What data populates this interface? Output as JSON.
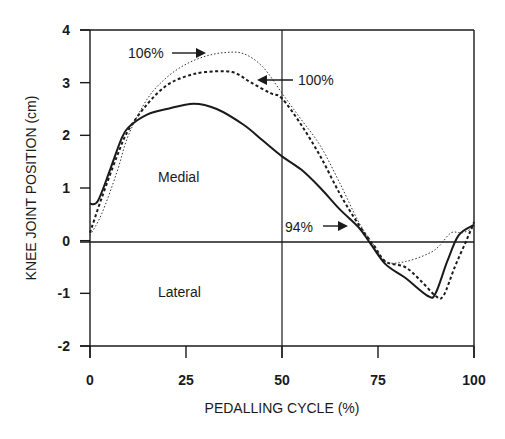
{
  "chart_data": {
    "type": "line",
    "title": "",
    "xlabel": "PEDALLING CYCLE (%)",
    "ylabel": "KNEE JOINT POSITION (cm)",
    "xlim": [
      0,
      100
    ],
    "ylim": [
      -2,
      4
    ],
    "xticks": [
      0,
      25,
      50,
      75,
      100
    ],
    "yticks": [
      -2,
      -1,
      0,
      1,
      2,
      3,
      4
    ],
    "grid": false,
    "reference_lines": {
      "horizontal": [
        0
      ],
      "vertical": [
        50
      ]
    },
    "region_labels": [
      {
        "text": "Medial",
        "x": 18,
        "y": 1.2
      },
      {
        "text": "Lateral",
        "x": 18,
        "y": -0.95
      }
    ],
    "series": [
      {
        "name": "94%",
        "style": "solid",
        "x": [
          0,
          2,
          5,
          8,
          10,
          15,
          20,
          27,
          33,
          40,
          45,
          50,
          55,
          60,
          65,
          70,
          73,
          77,
          82,
          88,
          90,
          93,
          96,
          100
        ],
        "y": [
          0.7,
          0.75,
          1.3,
          1.9,
          2.15,
          2.4,
          2.5,
          2.6,
          2.5,
          2.2,
          1.9,
          1.6,
          1.35,
          1.0,
          0.6,
          0.25,
          -0.05,
          -0.45,
          -0.7,
          -1.05,
          -1.0,
          -0.4,
          0.1,
          0.3
        ]
      },
      {
        "name": "100%",
        "style": "dashed",
        "x": [
          0,
          3,
          7,
          10,
          15,
          20,
          25,
          30,
          37,
          42,
          47,
          50,
          55,
          60,
          65,
          70,
          74,
          77,
          82,
          86,
          90,
          92,
          95,
          98,
          100
        ],
        "y": [
          0.15,
          0.8,
          1.6,
          2.1,
          2.6,
          2.95,
          3.12,
          3.2,
          3.2,
          3.0,
          2.8,
          2.7,
          2.2,
          1.6,
          0.9,
          0.3,
          -0.1,
          -0.4,
          -0.5,
          -0.75,
          -1.05,
          -1.05,
          -0.5,
          0.0,
          0.35
        ]
      },
      {
        "name": "106%",
        "style": "dotted",
        "x": [
          0,
          3,
          7,
          10,
          15,
          20,
          25,
          30,
          35,
          40,
          45,
          50,
          55,
          60,
          65,
          70,
          74,
          77,
          82,
          88,
          91,
          94,
          97,
          100
        ],
        "y": [
          0.1,
          0.5,
          1.3,
          2.0,
          2.7,
          3.1,
          3.35,
          3.5,
          3.57,
          3.55,
          3.3,
          2.8,
          2.3,
          1.8,
          1.1,
          0.35,
          -0.1,
          -0.4,
          -0.4,
          -0.25,
          -0.1,
          0.15,
          0.15,
          0.25
        ]
      }
    ],
    "annotations": [
      {
        "text": "106%",
        "arrow": "right",
        "label_x": 10,
        "label_y": 3.6,
        "arrow_to_x": 32,
        "arrow_to_y": 3.6
      },
      {
        "text": "100%",
        "arrow": "left",
        "label_x": 54,
        "label_y": 3.07,
        "arrow_to_x": 43,
        "arrow_to_y": 3.1
      },
      {
        "text": "94%",
        "arrow": "right",
        "label_x": 50.5,
        "label_y": 0.3,
        "arrow_to_x": 67,
        "arrow_to_y": 0.3
      }
    ]
  },
  "labels": {
    "xlabel": "PEDALLING CYCLE (%)",
    "ylabel": "KNEE JOINT POSITION (cm)",
    "medial": "Medial",
    "lateral": "Lateral",
    "ann_106": "106%",
    "ann_100": "100%",
    "ann_94": "94%",
    "xticks": [
      "0",
      "25",
      "50",
      "75",
      "100"
    ],
    "yticks": [
      "4",
      "3",
      "2",
      "1",
      "0",
      "-1",
      "-2"
    ]
  }
}
